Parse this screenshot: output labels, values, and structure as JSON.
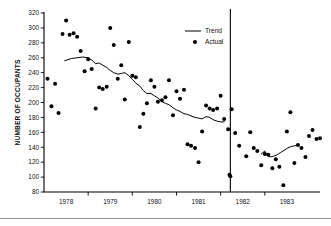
{
  "chart_data": {
    "type": "scatter",
    "title": "",
    "subtitle": "",
    "xlabel": "",
    "ylabel": "NUMBER OF OCCUPANTS",
    "xlim": [
      1977.5,
      1983.75
    ],
    "ylim": [
      80,
      320
    ],
    "ytick_step": 20,
    "yticks": [
      80,
      100,
      120,
      140,
      160,
      180,
      200,
      220,
      240,
      260,
      280,
      300,
      320
    ],
    "ytick_labels": [
      "80",
      "100",
      "120",
      "140",
      "160",
      "180",
      "200",
      "220",
      "240",
      "260",
      "280",
      "300",
      "320"
    ],
    "xticks": [
      1978,
      1979,
      1980,
      1981,
      1982,
      1983
    ],
    "xtick_labels": [
      "1978",
      "1979",
      "1980",
      "1981",
      "1982",
      "1983"
    ],
    "grid": false,
    "legend_position": "top-right",
    "legend": [
      {
        "name": "Trend",
        "marker": "line"
      },
      {
        "name": "Actual",
        "marker": "dot"
      }
    ],
    "annotations": [
      {
        "type": "vertical-line",
        "x": 1981.72,
        "label": "intervention-divider"
      }
    ],
    "series": [
      {
        "name": "Actual",
        "marker": "dot",
        "points": [
          [
            1977.58,
            232
          ],
          [
            1977.67,
            195
          ],
          [
            1977.75,
            225
          ],
          [
            1977.83,
            186
          ],
          [
            1977.92,
            292
          ],
          [
            1978.0,
            310
          ],
          [
            1978.08,
            291
          ],
          [
            1978.17,
            293
          ],
          [
            1978.25,
            288
          ],
          [
            1978.33,
            269
          ],
          [
            1978.42,
            242
          ],
          [
            1978.5,
            258
          ],
          [
            1978.58,
            245
          ],
          [
            1978.67,
            192
          ],
          [
            1978.75,
            220
          ],
          [
            1978.83,
            218
          ],
          [
            1978.92,
            221
          ],
          [
            1979.0,
            300
          ],
          [
            1979.08,
            277
          ],
          [
            1979.17,
            232
          ],
          [
            1979.25,
            250
          ],
          [
            1979.33,
            204
          ],
          [
            1979.42,
            281
          ],
          [
            1979.5,
            236
          ],
          [
            1979.58,
            234
          ],
          [
            1979.67,
            167
          ],
          [
            1979.75,
            185
          ],
          [
            1979.83,
            199
          ],
          [
            1979.92,
            230
          ],
          [
            1980.0,
            221
          ],
          [
            1980.08,
            201
          ],
          [
            1980.17,
            203
          ],
          [
            1980.25,
            207
          ],
          [
            1980.33,
            230
          ],
          [
            1980.42,
            183
          ],
          [
            1980.5,
            215
          ],
          [
            1980.58,
            205
          ],
          [
            1980.67,
            217
          ],
          [
            1980.75,
            144
          ],
          [
            1980.83,
            142
          ],
          [
            1980.92,
            139
          ],
          [
            1981.0,
            120
          ],
          [
            1981.08,
            161
          ],
          [
            1981.17,
            196
          ],
          [
            1981.25,
            192
          ],
          [
            1981.33,
            190
          ],
          [
            1981.42,
            192
          ],
          [
            1981.5,
            209
          ],
          [
            1981.58,
            178
          ],
          [
            1981.67,
            164
          ],
          [
            1981.75,
            191
          ],
          [
            1981.83,
            159
          ],
          [
            1981.92,
            142
          ],
          [
            1981.7,
            103
          ],
          [
            1981.72,
            101
          ],
          [
            1982.08,
            128
          ],
          [
            1982.17,
            160
          ],
          [
            1982.25,
            139
          ],
          [
            1982.33,
            135
          ],
          [
            1982.42,
            116
          ],
          [
            1982.5,
            131
          ],
          [
            1982.58,
            130
          ],
          [
            1982.67,
            112
          ],
          [
            1982.75,
            124
          ],
          [
            1982.83,
            114
          ],
          [
            1982.92,
            89
          ],
          [
            1983.0,
            161
          ],
          [
            1983.08,
            187
          ],
          [
            1983.17,
            119
          ],
          [
            1983.25,
            143
          ],
          [
            1983.33,
            139
          ],
          [
            1983.42,
            127
          ],
          [
            1983.5,
            155
          ],
          [
            1983.58,
            163
          ],
          [
            1983.67,
            151
          ],
          [
            1983.75,
            152
          ]
        ]
      },
      {
        "name": "Trend",
        "marker": "line",
        "segments": [
          {
            "id": "pre-intervention",
            "points": [
              [
                1977.97,
                256
              ],
              [
                1978.12,
                259
              ],
              [
                1978.25,
                260
              ],
              [
                1978.38,
                261
              ],
              [
                1978.5,
                260
              ],
              [
                1978.58,
                257
              ],
              [
                1978.67,
                252
              ],
              [
                1978.75,
                253
              ],
              [
                1978.83,
                250
              ],
              [
                1978.92,
                247
              ],
              [
                1979.0,
                243
              ],
              [
                1979.08,
                240
              ],
              [
                1979.17,
                238
              ],
              [
                1979.25,
                239
              ],
              [
                1979.33,
                240
              ],
              [
                1979.42,
                236
              ],
              [
                1979.5,
                231
              ],
              [
                1979.58,
                226
              ],
              [
                1979.67,
                222
              ],
              [
                1979.75,
                216
              ],
              [
                1979.83,
                212
              ],
              [
                1979.92,
                212
              ],
              [
                1980.0,
                209
              ],
              [
                1980.08,
                206
              ],
              [
                1980.17,
                201
              ],
              [
                1980.25,
                199
              ],
              [
                1980.33,
                197
              ],
              [
                1980.42,
                193
              ],
              [
                1980.5,
                190
              ],
              [
                1980.58,
                188
              ],
              [
                1980.67,
                185
              ],
              [
                1980.75,
                184
              ],
              [
                1980.83,
                182
              ],
              [
                1980.92,
                180
              ],
              [
                1981.0,
                179
              ],
              [
                1981.08,
                178
              ],
              [
                1981.17,
                181
              ],
              [
                1981.25,
                180
              ],
              [
                1981.33,
                177
              ],
              [
                1981.42,
                175
              ],
              [
                1981.5,
                174
              ],
              [
                1981.58,
                174
              ]
            ]
          },
          {
            "id": "post-intervention",
            "points": [
              [
                1982.42,
                131
              ],
              [
                1982.5,
                135
              ],
              [
                1982.55,
                129
              ],
              [
                1982.62,
                127
              ],
              [
                1982.7,
                128
              ],
              [
                1982.78,
                130
              ],
              [
                1982.86,
                133
              ],
              [
                1982.94,
                136
              ],
              [
                1983.02,
                139
              ],
              [
                1983.1,
                141
              ],
              [
                1983.18,
                142
              ],
              [
                1983.26,
                143
              ]
            ]
          }
        ]
      }
    ]
  }
}
